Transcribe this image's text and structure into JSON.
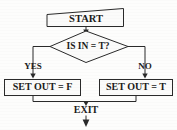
{
  "diagram": {
    "type": "flowchart",
    "title": "",
    "nodes": [
      {
        "id": "start",
        "shape": "rectangle",
        "label": "START"
      },
      {
        "id": "decision",
        "shape": "diamond",
        "label": "IS IN = T?"
      },
      {
        "id": "setf",
        "shape": "rectangle",
        "label": "SET OUT = F"
      },
      {
        "id": "sett",
        "shape": "rectangle",
        "label": "SET OUT = T"
      },
      {
        "id": "exit",
        "shape": "text",
        "label": "EXIT"
      }
    ],
    "edges": [
      {
        "from": "start",
        "to": "decision",
        "label": ""
      },
      {
        "from": "decision",
        "to": "setf",
        "label": "YES"
      },
      {
        "from": "decision",
        "to": "sett",
        "label": "NO"
      },
      {
        "from": "setf",
        "to": "exit",
        "label": ""
      },
      {
        "from": "sett",
        "to": "exit",
        "label": ""
      },
      {
        "from": "exit",
        "to": "",
        "label": ""
      }
    ],
    "branch_labels": {
      "yes": "YES",
      "no": "NO"
    },
    "colors": {
      "line": "#2a2a2a",
      "text": "#1b1b1b",
      "fill": "#fbfbfa",
      "background": "#fdfdfc"
    }
  }
}
